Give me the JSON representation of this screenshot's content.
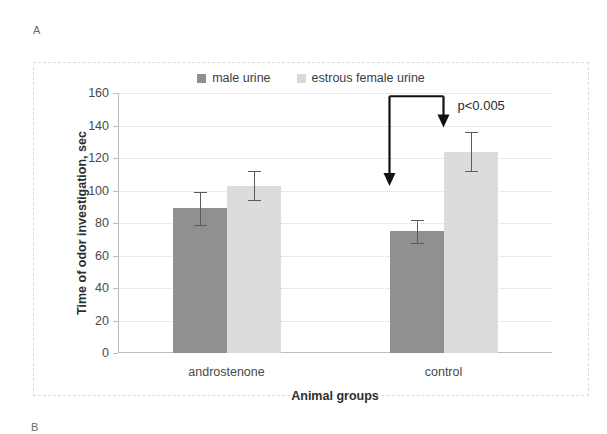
{
  "panels": {
    "a_label": "A",
    "b_label": "B"
  },
  "chart_data": {
    "type": "bar",
    "title": "",
    "xlabel": "Animal groups",
    "ylabel": "Time of odor investigation, sec",
    "categories": [
      "androstenone",
      "control"
    ],
    "ylim": [
      0,
      160
    ],
    "yticks": [
      0,
      20,
      40,
      60,
      80,
      100,
      120,
      140,
      160
    ],
    "ytick_labels": [
      "0",
      "20",
      "40",
      "60",
      "80",
      "100",
      "120",
      "140",
      "160"
    ],
    "grid": true,
    "legend_position": "top-center",
    "series": [
      {
        "name": "male urine",
        "color": "#909090",
        "values": [
          89,
          75
        ],
        "errors": [
          10,
          7
        ]
      },
      {
        "name": "estrous female urine",
        "color": "#dcdcdc",
        "values": [
          103,
          124
        ],
        "errors": [
          9,
          12
        ]
      }
    ],
    "annotations": [
      {
        "text": "p<0.005",
        "type": "significance-bracket",
        "from_group": "control",
        "from_series": "male urine",
        "to_group": "control",
        "to_series": "estrous female urine"
      }
    ]
  },
  "legend": {
    "items": [
      {
        "label": "male urine",
        "swatch": "male-urine-swatch"
      },
      {
        "label": "estrous female urine",
        "swatch": "estrous-female-urine-swatch"
      }
    ]
  }
}
